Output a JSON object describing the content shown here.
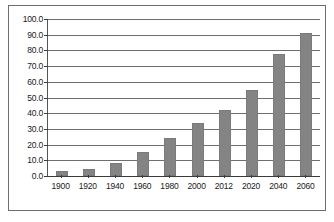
{
  "chart_data": {
    "type": "bar",
    "title": "",
    "subtitle": "",
    "xlabel": "",
    "ylabel": "",
    "categories": [
      "1900",
      "1920",
      "1940",
      "1960",
      "1980",
      "2000",
      "2012",
      "2020",
      "2040",
      "2060"
    ],
    "values": [
      3.0,
      4.5,
      8.0,
      15.5,
      24.5,
      34.0,
      42.0,
      55.0,
      78.0,
      91.0
    ],
    "ylim": [
      0.0,
      100.0
    ],
    "ytick_labels": [
      "100.0",
      "90.0",
      "80.0",
      "70.0",
      "60.0",
      "50.0",
      "40.0",
      "30.0",
      "20.0",
      "10.0",
      "0.0"
    ],
    "ytick_values": [
      100.0,
      90.0,
      80.0,
      70.0,
      60.0,
      50.0,
      40.0,
      30.0,
      20.0,
      10.0,
      0.0
    ],
    "ystep": 10.0,
    "grid": true,
    "legend": false,
    "legend_position": "none",
    "series": [
      {
        "name": "",
        "color": "#848484",
        "values": [
          3.0,
          4.5,
          8.0,
          15.5,
          24.5,
          34.0,
          42.0,
          55.0,
          78.0,
          91.0
        ]
      }
    ]
  },
  "style": {
    "bar_color": "#848484",
    "bar_border_color": "#7a7a7a",
    "grid_color": "#6e6e6e",
    "axis_color": "#3b3b3b",
    "frame_color": "#6e6e6e",
    "background": "#ffffff",
    "text_color": "#1a1a1a"
  }
}
